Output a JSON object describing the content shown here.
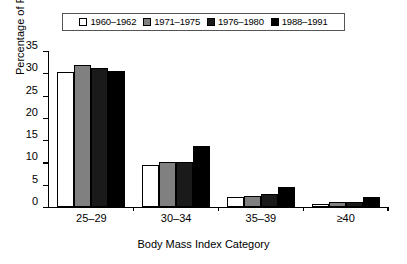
{
  "chart_data": {
    "type": "bar",
    "title": "",
    "xlabel": "Body Mass Index Category",
    "ylabel": "Percentage of Persons",
    "categories": [
      "25–29",
      "30–34",
      "35–39",
      "≥40"
    ],
    "ylim": [
      0,
      35
    ],
    "yticks": [
      0,
      5,
      10,
      15,
      20,
      25,
      30,
      35
    ],
    "ytick_labels": [
      "0",
      "5",
      "10",
      "15",
      "20",
      "25",
      "30",
      "35"
    ],
    "grid": false,
    "legend_position": "top-center",
    "series": [
      {
        "name": "1960–1962",
        "color": "#ffffff",
        "values": [
          30.2,
          9.5,
          2.3,
          0.6
        ]
      },
      {
        "name": "1971–1975",
        "color": "#808080",
        "values": [
          31.8,
          10.0,
          2.5,
          1.1
        ]
      },
      {
        "name": "1976–1980",
        "color": "#1a1a1a",
        "values": [
          31.2,
          10.0,
          2.9,
          1.2
        ]
      },
      {
        "name": "1988–1991",
        "color": "#000000",
        "values": [
          30.5,
          13.8,
          4.5,
          2.2
        ]
      }
    ]
  },
  "legend": {
    "items": [
      {
        "label": "1960–1962",
        "swatch": "#ffffff"
      },
      {
        "label": "1971–1975",
        "swatch": "#808080"
      },
      {
        "label": "1976–1980",
        "swatch": "#1a1a1a"
      },
      {
        "label": "1988–1991",
        "swatch": "#000000"
      }
    ]
  },
  "axes": {
    "y_title": "Percentage of Persons",
    "x_title": "Body Mass Index Category"
  }
}
